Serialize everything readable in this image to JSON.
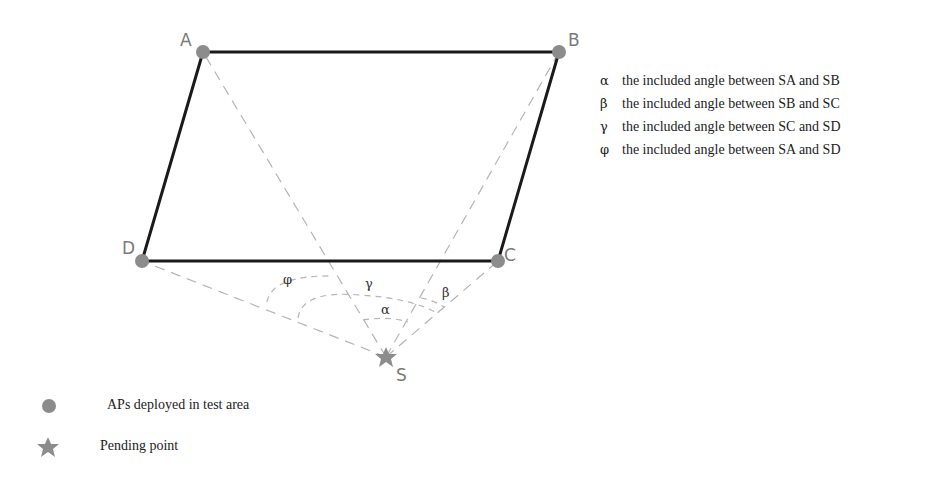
{
  "points": {
    "A": {
      "label": "A",
      "x": 203,
      "y": 52
    },
    "B": {
      "label": "B",
      "x": 559,
      "y": 52
    },
    "C": {
      "label": "C",
      "x": 498,
      "y": 261
    },
    "D": {
      "label": "D",
      "x": 142,
      "y": 261
    },
    "S": {
      "label": "S",
      "x": 386,
      "y": 357
    }
  },
  "angles": {
    "alpha": "α",
    "beta": "β",
    "gamma": "γ",
    "phi": "φ"
  },
  "definitions": [
    {
      "symbol": "α",
      "text": "the included angle between SA and SB"
    },
    {
      "symbol": "β",
      "text": "the included angle between SB and SC"
    },
    {
      "symbol": "γ",
      "text": "the included angle between SC and SD"
    },
    {
      "symbol": "φ",
      "text": "the included angle between SA and SD"
    }
  ],
  "legend": {
    "ap": {
      "icon": "circle-marker",
      "text": "APs deployed in test area"
    },
    "pending": {
      "icon": "star-marker",
      "text": "Pending point"
    }
  },
  "colors": {
    "edge": "#1a1a1a",
    "dashed": "#b0b0b0",
    "marker": "#8c8c8c"
  }
}
